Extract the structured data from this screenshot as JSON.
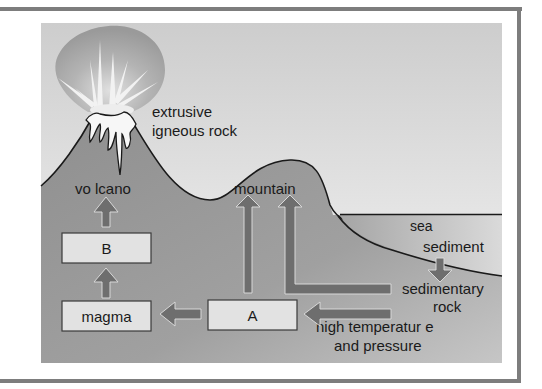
{
  "diagram": {
    "labels": {
      "extrusive_line1": "extrusive",
      "extrusive_line2": "igneous rock",
      "volcano": "vo lcano",
      "mountain": "mountain",
      "sea": "sea",
      "sediment": "sediment",
      "sedimentary_line1": "sedimentary",
      "sedimentary_line2": "rock",
      "pressure_line1": "high temperatur e",
      "pressure_line2": "and pressure"
    },
    "boxes": {
      "b": "B",
      "magma": "magma",
      "a": "A"
    },
    "colors": {
      "sky_top": "#cfcfcf",
      "sky_bottom": "#f6f6f6",
      "ground": "#9a9a9a",
      "ground_dark": "#8a8a8a",
      "arrow": "#6e6e6e",
      "box_fill": "#e2e2e2",
      "frame": "#7d7d7d"
    }
  }
}
